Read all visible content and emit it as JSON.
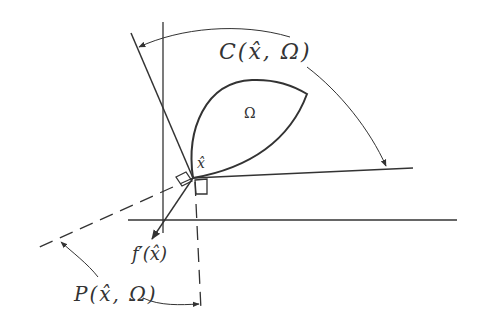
{
  "diagram": {
    "type": "geometric-cone-diagram",
    "labels": {
      "tangent_cone": "C(x̂, Ω)",
      "set": "Ω",
      "point": "x̂",
      "gradient": "f′(x̂)",
      "polar_cone": "P(x̂, Ω)"
    },
    "colors": {
      "stroke": "#333333",
      "background": "#ffffff"
    }
  }
}
